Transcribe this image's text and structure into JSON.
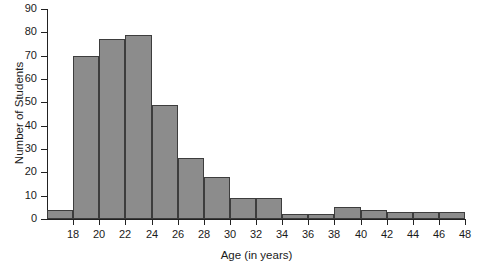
{
  "chart_data": {
    "type": "bar",
    "title": "",
    "subtitle": "",
    "xlabel": "Age (in years)",
    "ylabel": "Number of Students",
    "grid": false,
    "legend": null,
    "legend_position": "none",
    "bin_width": 2,
    "bin_edges": [
      16,
      18,
      20,
      22,
      24,
      26,
      28,
      30,
      32,
      34,
      36,
      38,
      40,
      42,
      44,
      46,
      48
    ],
    "categories": [
      "16-18",
      "18-20",
      "20-22",
      "22-24",
      "24-26",
      "26-28",
      "28-30",
      "30-32",
      "32-34",
      "34-36",
      "36-38",
      "38-40",
      "40-42",
      "42-44",
      "44-46",
      "46-48"
    ],
    "values": [
      4,
      70,
      77,
      79,
      49,
      26,
      18,
      9,
      9,
      2,
      2,
      5,
      4,
      3,
      3,
      3
    ],
    "xlim": [
      16,
      48
    ],
    "ylim": [
      0,
      90
    ],
    "ytick_labels": [
      "0",
      "10",
      "20",
      "30",
      "40",
      "50",
      "60",
      "70",
      "80",
      "90"
    ],
    "ytick_values": [
      0,
      10,
      20,
      30,
      40,
      50,
      60,
      70,
      80,
      90
    ],
    "xtick_labels": [
      "18",
      "20",
      "22",
      "24",
      "26",
      "28",
      "30",
      "32",
      "34",
      "36",
      "38",
      "40",
      "42",
      "44",
      "46",
      "48"
    ],
    "xtick_values": [
      18,
      20,
      22,
      24,
      26,
      28,
      30,
      32,
      34,
      36,
      38,
      40,
      42,
      44,
      46,
      48
    ],
    "colors": {
      "bar_fill": "#8c8c8c",
      "bar_edge": "#3d3d3d",
      "axis": "#222222",
      "text": "#1a1a1a",
      "background": "#ffffff"
    }
  }
}
